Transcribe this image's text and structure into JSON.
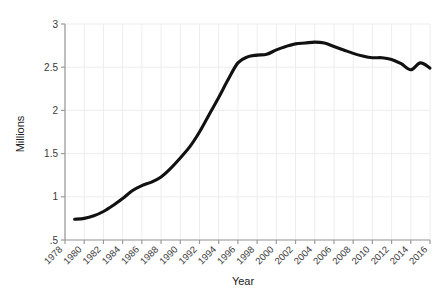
{
  "chart_data": {
    "type": "line",
    "title": "",
    "subtitle": "",
    "xlabel": "Year",
    "ylabel": "Millions",
    "xlim": [
      1978,
      2016
    ],
    "ylim": [
      0.5,
      3.0
    ],
    "grid": true,
    "legend": null,
    "line_color": "#111111",
    "axis_color": "#9a9a9a",
    "grid_color": "#ededed",
    "x_tick_labels": [
      "1978",
      "1980",
      "1982",
      "1984",
      "1986",
      "1988",
      "1990",
      "1992",
      "1994",
      "1996",
      "1998",
      "2000",
      "2002",
      "2004",
      "2006",
      "2008",
      "2010",
      "2012",
      "2014",
      "2016"
    ],
    "y_tick_labels": [
      ".5",
      "1",
      "1.5",
      "2",
      "2.5",
      "3"
    ],
    "y_tick_values": [
      0.5,
      1,
      1.5,
      2,
      2.5,
      3
    ],
    "x": [
      1979,
      1980,
      1981,
      1982,
      1983,
      1984,
      1985,
      1986,
      1987,
      1988,
      1989,
      1990,
      1991,
      1992,
      1993,
      1994,
      1995,
      1996,
      1997,
      1998,
      1999,
      2000,
      2001,
      2002,
      2003,
      2004,
      2005,
      2006,
      2007,
      2008,
      2009,
      2010,
      2011,
      2012,
      2013,
      2014,
      2015,
      2016
    ],
    "values": [
      0.74,
      0.75,
      0.78,
      0.83,
      0.9,
      0.98,
      1.07,
      1.13,
      1.17,
      1.23,
      1.33,
      1.45,
      1.58,
      1.75,
      1.95,
      2.15,
      2.36,
      2.55,
      2.62,
      2.64,
      2.65,
      2.7,
      2.74,
      2.77,
      2.78,
      2.79,
      2.78,
      2.74,
      2.7,
      2.66,
      2.63,
      2.61,
      2.61,
      2.59,
      2.54,
      2.47,
      2.55,
      2.49
    ],
    "series": [
      {
        "name": "Millions",
        "values": [
          0.74,
          0.75,
          0.78,
          0.83,
          0.9,
          0.98,
          1.07,
          1.13,
          1.17,
          1.23,
          1.33,
          1.45,
          1.58,
          1.75,
          1.95,
          2.15,
          2.36,
          2.55,
          2.62,
          2.64,
          2.65,
          2.7,
          2.74,
          2.77,
          2.78,
          2.79,
          2.78,
          2.74,
          2.7,
          2.66,
          2.63,
          2.61,
          2.61,
          2.59,
          2.54,
          2.47,
          2.55,
          2.49
        ]
      }
    ]
  },
  "axes": {
    "y_title": "Millions",
    "x_title": "Year"
  }
}
